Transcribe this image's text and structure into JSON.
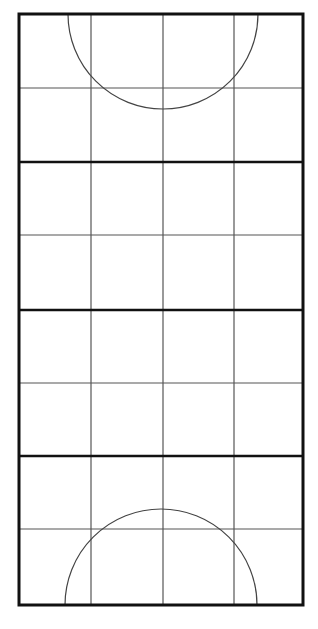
{
  "diagram": {
    "type": "court-grid",
    "width": 318,
    "height": 629,
    "colors": {
      "background": "#ffffff",
      "thick_line": "#111111",
      "thin_line": "#555555",
      "arc": "#444444"
    },
    "outer_border": {
      "x1": 19,
      "y1": 14,
      "x2": 303,
      "y2": 605,
      "stroke_width": 3
    },
    "columns": 4,
    "rows": 8,
    "vertical_lines_x": [
      91,
      163,
      234
    ],
    "thick_horizontal_lines_y": [
      162,
      310,
      456
    ],
    "thin_horizontal_lines_y": [
      88,
      235,
      383,
      529
    ],
    "arcs": [
      {
        "name": "top-semicircle",
        "cx": 163,
        "cy": 14,
        "r": 95,
        "opens": "down"
      },
      {
        "name": "bottom-semicircle",
        "cx": 161,
        "cy": 605,
        "r": 96,
        "opens": "up"
      }
    ]
  }
}
